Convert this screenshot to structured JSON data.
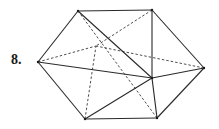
{
  "figure": {
    "label": "8.",
    "type": "polyhedron-wireframe",
    "vertices": {
      "left": [
        38,
        62
      ],
      "top_left": [
        78,
        11
      ],
      "top_right": [
        152,
        10
      ],
      "right": [
        204,
        68
      ],
      "front": [
        152,
        78
      ],
      "bottom_right": [
        157,
        118
      ],
      "bottom_left": [
        85,
        119
      ],
      "hidden": [
        96,
        46
      ]
    },
    "solid_edges": [
      [
        "left",
        "top_left"
      ],
      [
        "top_left",
        "top_right"
      ],
      [
        "top_right",
        "right"
      ],
      [
        "right",
        "bottom_right"
      ],
      [
        "bottom_right",
        "bottom_left"
      ],
      [
        "bottom_left",
        "left"
      ],
      [
        "left",
        "front"
      ],
      [
        "top_left",
        "front"
      ],
      [
        "top_right",
        "front"
      ],
      [
        "right",
        "front"
      ],
      [
        "bottom_right",
        "front"
      ],
      [
        "bottom_left",
        "front"
      ]
    ],
    "dashed_edges": [
      [
        "left",
        "hidden"
      ],
      [
        "top_right",
        "hidden"
      ],
      [
        "right",
        "hidden"
      ],
      [
        "bottom_left",
        "hidden"
      ],
      [
        "top_left",
        "bottom_right"
      ]
    ],
    "colors": {
      "line": "#2a2a2a",
      "background": "#ffffff"
    }
  }
}
